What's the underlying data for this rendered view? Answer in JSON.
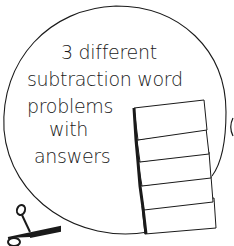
{
  "title_lines": [
    "3 different",
    "subtraction word",
    "problems",
    "with",
    "answers"
  ],
  "icons": [
    "scissors-icon",
    "stacked-cards-icon"
  ],
  "colors": {
    "stroke": "#1a1a1a",
    "background": "#ffffff"
  }
}
